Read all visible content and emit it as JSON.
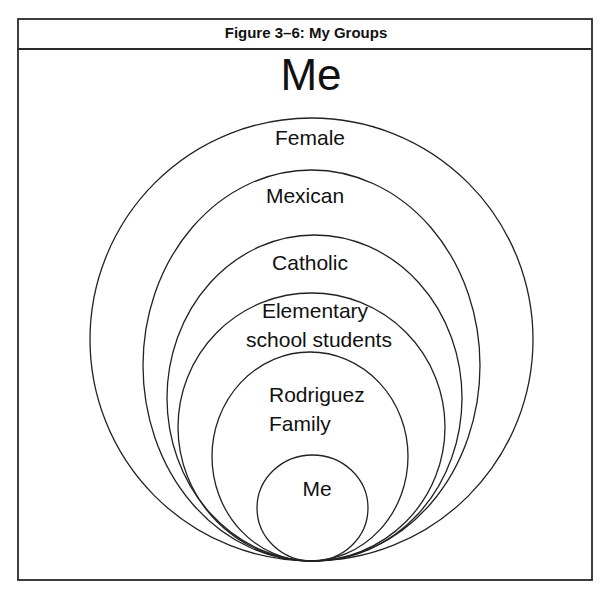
{
  "figure": {
    "title": "Figure 3–6: My Groups",
    "heading": "Me"
  },
  "frame": {
    "x": 18,
    "y": 19,
    "width": 574,
    "height": 561,
    "header_divider_y": 49
  },
  "groups": [
    {
      "name": "Female",
      "cx": 311.5,
      "cy": 339.5,
      "rx": 221.5,
      "ry": 221.5,
      "lines": [
        {
          "text": "Female",
          "x": 310,
          "y": 145,
          "anchor": "middle"
        }
      ]
    },
    {
      "name": "Mexican",
      "cx": 311.5,
      "cy": 365.5,
      "rx": 168.5,
      "ry": 195.5,
      "lines": [
        {
          "text": "Mexican",
          "x": 305,
          "y": 203,
          "anchor": "middle"
        }
      ]
    },
    {
      "name": "Catholic",
      "cx": 314.5,
      "cy": 398,
      "rx": 147.5,
      "ry": 163,
      "lines": [
        {
          "text": "Catholic",
          "x": 310,
          "y": 270,
          "anchor": "middle"
        }
      ]
    },
    {
      "name": "Elementary school students",
      "cx": 311.5,
      "cy": 427,
      "rx": 133.5,
      "ry": 134,
      "lines": [
        {
          "text": "Elementary",
          "x": 315,
          "y": 318,
          "anchor": "middle"
        },
        {
          "text": "school students",
          "x": 319,
          "y": 347,
          "anchor": "middle"
        }
      ]
    },
    {
      "name": "Rodriguez Family",
      "cx": 310,
      "cy": 456.5,
      "rx": 98,
      "ry": 104.5,
      "lines": [
        {
          "text": "Rodriguez",
          "x": 269,
          "y": 402,
          "anchor": "start"
        },
        {
          "text": "Family",
          "x": 269,
          "y": 431,
          "anchor": "start"
        }
      ]
    },
    {
      "name": "Me",
      "cx": 312.5,
      "cy": 508,
      "rx": 55.5,
      "ry": 53,
      "lines": [
        {
          "text": "Me",
          "x": 317,
          "y": 496,
          "anchor": "middle"
        }
      ]
    }
  ],
  "colors": {
    "stroke": "#222222",
    "text": "#111111",
    "background": "#ffffff"
  }
}
